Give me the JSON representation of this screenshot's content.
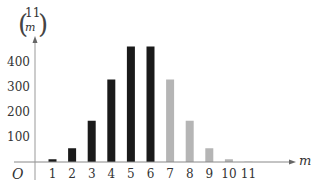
{
  "chart_data": {
    "type": "bar",
    "title": "",
    "xlabel": "m",
    "ylabel": "(11 choose m)",
    "ylabel_top": "11",
    "ylabel_bottom": "m",
    "origin_label": "O",
    "categories": [
      "1",
      "2",
      "3",
      "4",
      "5",
      "6",
      "7",
      "8",
      "9",
      "10",
      "11"
    ],
    "values": [
      11,
      55,
      165,
      330,
      462,
      462,
      330,
      165,
      55,
      11,
      1
    ],
    "bar_colors": [
      "#1a1a1a",
      "#1a1a1a",
      "#1a1a1a",
      "#1a1a1a",
      "#1a1a1a",
      "#1a1a1a",
      "#b5b5b5",
      "#b5b5b5",
      "#b5b5b5",
      "#b5b5b5",
      "#b5b5b5"
    ],
    "yticks": [
      100,
      200,
      300,
      400
    ],
    "ylim": [
      0,
      500
    ],
    "grid": false,
    "legend": "none"
  }
}
